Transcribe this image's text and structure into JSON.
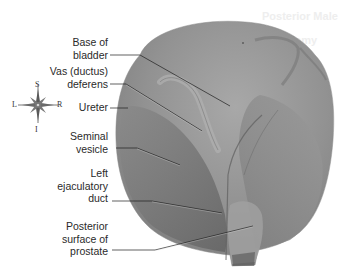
{
  "figure": {
    "background_ghost_text": [
      "Posterior Male",
      "Anatomy"
    ],
    "labels": [
      {
        "id": "base-of-bladder",
        "lines": [
          "Base of",
          "bladder"
        ]
      },
      {
        "id": "vas-deferens",
        "lines": [
          "Vas (ductus)",
          "deferens"
        ]
      },
      {
        "id": "ureter",
        "lines": [
          "Ureter"
        ]
      },
      {
        "id": "seminal-vesicle",
        "lines": [
          "Seminal",
          "vesicle"
        ]
      },
      {
        "id": "left-ejaculatory-duct",
        "lines": [
          "Left",
          "ejaculatory",
          "duct"
        ]
      },
      {
        "id": "posterior-surface-prostate",
        "lines": [
          "Posterior",
          "surface of",
          "prostate"
        ]
      }
    ],
    "compass": {
      "top": "S",
      "bottom": "I",
      "left": "L",
      "right": "R"
    },
    "colors": {
      "specimen_base": "#8e8e8e",
      "specimen_light": "#a6a6a6",
      "specimen_dark": "#6e6e6e",
      "label_text": "#2a2a2a",
      "leader_line": "#1e1e1e"
    }
  }
}
